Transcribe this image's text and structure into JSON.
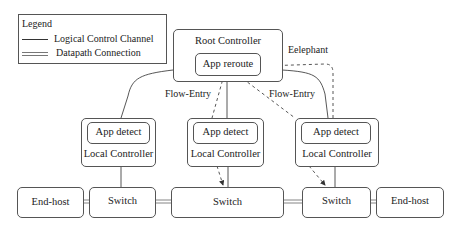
{
  "legend": {
    "title": "Legend",
    "items": [
      {
        "style": "single-line",
        "label": "Logical Control Channel"
      },
      {
        "style": "double-line",
        "label": "Datapath Connection"
      }
    ]
  },
  "root_controller": {
    "label": "Root Controller",
    "app": "App reroute"
  },
  "local_controllers": [
    {
      "label": "Local Controller",
      "app": "App detect"
    },
    {
      "label": "Local Controller",
      "app": "App detect"
    },
    {
      "label": "Local Controller",
      "app": "App detect"
    }
  ],
  "datapath": [
    {
      "type": "end-host",
      "label": "End-host"
    },
    {
      "type": "switch",
      "label": "Switch"
    },
    {
      "type": "switch",
      "label": "Switch"
    },
    {
      "type": "switch",
      "label": "Switch"
    },
    {
      "type": "end-host",
      "label": "End-host"
    }
  ],
  "annotations": {
    "flow_entry_left": "Flow-Entry",
    "flow_entry_right": "Flow-Entry",
    "elephant": "Eelephant"
  },
  "colors": {
    "line": "#444444",
    "border": "#555555",
    "background": "#ffffff"
  }
}
